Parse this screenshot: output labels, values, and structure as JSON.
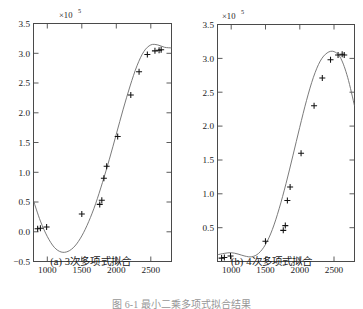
{
  "figure": {
    "bottom_caption": "图 6-1  最小二乘多项式拟合结果",
    "panels": [
      {
        "id": "a",
        "caption": "(a) 3次多项式拟合",
        "exponent_label": "×10",
        "exponent_sup": "5"
      },
      {
        "id": "b",
        "caption": "(b) 4次多项式拟合",
        "exponent_label": "×10",
        "exponent_sup": "5"
      }
    ]
  },
  "chart_data": [
    {
      "type": "scatter",
      "panel": "a",
      "title": "(a) 3次多项式拟合",
      "xlabel": "",
      "ylabel": "",
      "y_scale_label": "×10^5",
      "xlim": [
        800,
        2800
      ],
      "ylim": [
        -0.5,
        3.5
      ],
      "xticks": [
        1000,
        1500,
        2000,
        2500
      ],
      "xticklabels": [
        "1000",
        "1500",
        "2000",
        "2500"
      ],
      "yticks": [
        -0.5,
        0.0,
        0.5,
        1.0,
        1.5,
        2.0,
        2.5,
        3.0,
        3.5
      ],
      "yticklabels": [
        "−0.5",
        "0.0",
        "0.5",
        "1.0",
        "1.5",
        "2.0",
        "2.5",
        "3.0",
        "3.5"
      ],
      "grid": false,
      "legend": "none",
      "series": [
        {
          "name": "data points",
          "marker": "plus",
          "x": [
            860,
            900,
            990,
            1500,
            1760,
            1790,
            1820,
            1860,
            2020,
            2210,
            2330,
            2450,
            2560,
            2620,
            2650
          ],
          "y": [
            0.05,
            0.06,
            0.08,
            0.3,
            0.46,
            0.53,
            0.9,
            1.1,
            1.6,
            2.3,
            2.69,
            2.98,
            3.04,
            3.05,
            3.06
          ]
        },
        {
          "name": "cubic fit curve",
          "marker": "none",
          "x": [
            800,
            900,
            1000,
            1100,
            1200,
            1300,
            1400,
            1500,
            1600,
            1700,
            1800,
            1900,
            2000,
            2100,
            2200,
            2300,
            2400,
            2500,
            2600,
            2700,
            2800
          ],
          "y": [
            0.52,
            0.18,
            -0.08,
            -0.26,
            -0.34,
            -0.33,
            -0.24,
            -0.07,
            0.17,
            0.47,
            0.83,
            1.22,
            1.64,
            2.06,
            2.45,
            2.79,
            3.03,
            3.14,
            3.14,
            3.1,
            3.09
          ]
        }
      ]
    },
    {
      "type": "scatter",
      "panel": "b",
      "title": "(b) 4次多项式拟合",
      "xlabel": "",
      "ylabel": "",
      "y_scale_label": "×10^5",
      "xlim": [
        800,
        2800
      ],
      "ylim": [
        0.0,
        3.5
      ],
      "xticks": [
        1000,
        1500,
        2000,
        2500
      ],
      "xticklabels": [
        "1000",
        "1500",
        "2000",
        "2500"
      ],
      "yticks": [
        0.5,
        1.0,
        1.5,
        2.0,
        2.5,
        3.0,
        3.5
      ],
      "yticklabels": [
        "0.5",
        "1.0",
        "1.5",
        "2.0",
        "2.5",
        "3.0",
        "3.5"
      ],
      "grid": false,
      "legend": "none",
      "series": [
        {
          "name": "data points",
          "marker": "plus",
          "x": [
            860,
            900,
            990,
            1500,
            1760,
            1790,
            1820,
            1860,
            2020,
            2210,
            2330,
            2450,
            2560,
            2620,
            2650
          ],
          "y": [
            0.05,
            0.06,
            0.08,
            0.3,
            0.46,
            0.53,
            0.9,
            1.1,
            1.6,
            2.3,
            2.71,
            2.98,
            3.05,
            3.06,
            3.05
          ]
        },
        {
          "name": "quartic fit curve",
          "marker": "none",
          "x": [
            800,
            900,
            1000,
            1100,
            1200,
            1300,
            1400,
            1500,
            1600,
            1700,
            1800,
            1900,
            2000,
            2100,
            2200,
            2300,
            2400,
            2500,
            2600,
            2700,
            2800
          ],
          "y": [
            0.1,
            0.12,
            0.13,
            0.11,
            0.08,
            0.07,
            0.12,
            0.25,
            0.47,
            0.78,
            1.15,
            1.56,
            1.98,
            2.38,
            2.72,
            2.96,
            3.08,
            3.1,
            3.0,
            2.72,
            2.3
          ]
        }
      ]
    }
  ]
}
